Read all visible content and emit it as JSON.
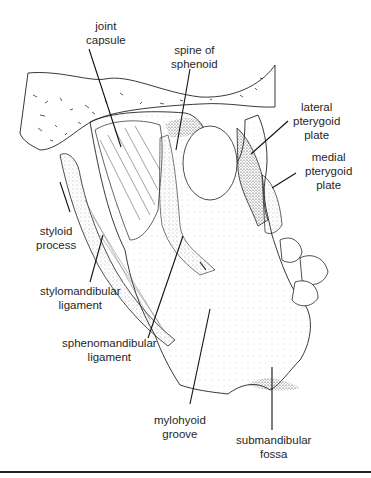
{
  "figure": {
    "labels": [
      {
        "id": "joint-capsule",
        "text": "joint\ncapsule",
        "x": 86,
        "y": 19
      },
      {
        "id": "spine-of-sphenoid",
        "text": "spine of\nsphenoid",
        "x": 180,
        "y": 44
      },
      {
        "id": "lateral-pterygoid-plate",
        "text": "lateral\npterygoid\nplate",
        "x": 292,
        "y": 102
      },
      {
        "id": "medial-pterygoid-plate",
        "text": "medial\npterygoid\nplate",
        "x": 304,
        "y": 152
      },
      {
        "id": "styloid-process",
        "text": "styloid\nprocess",
        "x": 37,
        "y": 225
      },
      {
        "id": "stylomandibular-ligament",
        "text": "stylomandibular\nligament",
        "x": 40,
        "y": 284
      },
      {
        "id": "sphenomandibular-ligament",
        "text": "sphenomandibular\nligament",
        "x": 62,
        "y": 336
      },
      {
        "id": "mylohyoid-groove",
        "text": "mylohyoid\ngroove",
        "x": 154,
        "y": 414
      },
      {
        "id": "submandibular-fossa",
        "text": "submandibular\nfossa",
        "x": 236,
        "y": 434
      }
    ]
  }
}
